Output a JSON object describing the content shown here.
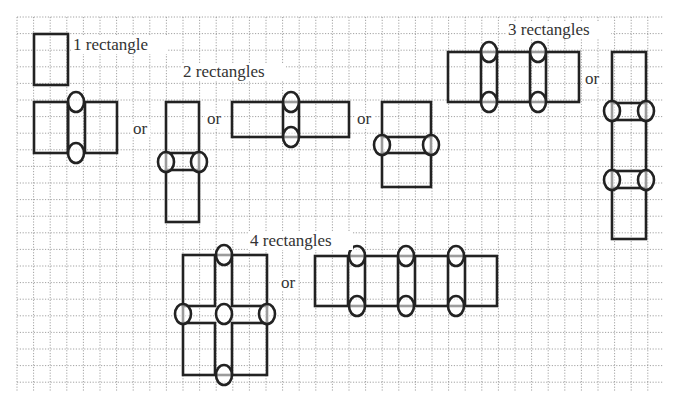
{
  "figure": {
    "width": 676,
    "height": 403,
    "background": "#ffffff",
    "grid": {
      "x0": 17,
      "y0": 17,
      "x1": 663,
      "y1": 392,
      "spacing": 16.6,
      "color": "#8a8a8a"
    },
    "stroke_color": "#222222",
    "text_color": "#333333"
  },
  "labels": [
    {
      "id": "label-1-rectangle",
      "text": "1 rectangle",
      "x": 73,
      "y": 50,
      "w": 92
    },
    {
      "id": "label-2-rectangles",
      "text": "2 rectangles",
      "x": 183,
      "y": 77,
      "w": 101
    },
    {
      "id": "label-3-rectangles",
      "text": "3 rectangles",
      "x": 508,
      "y": 35,
      "w": 101
    },
    {
      "id": "label-4-rectangles",
      "text": "4 rectangles",
      "x": 250,
      "y": 246,
      "w": 101
    }
  ],
  "or_labels": [
    {
      "text": "or",
      "x": 133,
      "y": 134
    },
    {
      "text": "or",
      "x": 207,
      "y": 124
    },
    {
      "text": "or",
      "x": 357,
      "y": 124
    },
    {
      "text": "or",
      "x": 585,
      "y": 84
    },
    {
      "text": "or",
      "x": 281,
      "y": 288
    }
  ],
  "groups": [
    {
      "name": "one-rectangle",
      "count": 1,
      "shapes": [
        {
          "name": "single-vertical",
          "rects": [
            [
              34,
              34,
              34,
              51
            ]
          ],
          "lines": [],
          "ellipses": []
        }
      ]
    },
    {
      "name": "two-rectangles",
      "count": 2,
      "shapes": [
        {
          "name": "two-side-by-side-tall",
          "rects": [
            [
              34,
              102,
              34,
              51
            ],
            [
              85,
              102,
              32,
              51
            ]
          ],
          "lines": [
            [
              68,
              102,
              68,
              153
            ]
          ],
          "ellipses": [
            [
              76,
              102
            ],
            [
              76,
              153
            ]
          ]
        },
        {
          "name": "two-stacked-tall",
          "rects": [
            [
              166,
              102,
              33,
              51
            ],
            [
              166,
              170,
              33,
              52
            ]
          ],
          "lines": [
            [
              166,
              153,
              166,
              170
            ],
            [
              199,
              153,
              199,
              170
            ]
          ],
          "ellipses": [
            [
              166,
              162
            ],
            [
              199,
              162
            ]
          ]
        },
        {
          "name": "two-side-by-side-wide",
          "rects": [
            [
              232,
              102,
              51,
              35
            ],
            [
              299,
              102,
              50,
              35
            ]
          ],
          "lines": [
            [
              283,
              102,
              299,
              102
            ],
            [
              283,
              137,
              299,
              137
            ]
          ],
          "ellipses": [
            [
              291,
              102
            ],
            [
              291,
              137
            ]
          ]
        },
        {
          "name": "two-stacked-wide",
          "rects": [
            [
              382,
              102,
              49,
              35
            ],
            [
              382,
              153,
              49,
              34
            ]
          ],
          "lines": [
            [
              382,
              137,
              382,
              153
            ],
            [
              431,
              137,
              431,
              153
            ]
          ],
          "ellipses": [
            [
              382,
              145
            ],
            [
              431,
              145
            ]
          ]
        }
      ]
    },
    {
      "name": "three-rectangles",
      "count": 3,
      "shapes": [
        {
          "name": "three-in-a-row",
          "rects": [
            [
              448,
              52,
              33,
              50
            ],
            [
              497,
              52,
              33,
              50
            ],
            [
              546,
              52,
              33,
              50
            ]
          ],
          "lines": [
            [
              481,
              52,
              497,
              52
            ],
            [
              481,
              102,
              497,
              102
            ],
            [
              530,
              52,
              546,
              52
            ],
            [
              530,
              102,
              546,
              102
            ]
          ],
          "ellipses": [
            [
              489,
              52
            ],
            [
              489,
              102
            ],
            [
              538,
              52
            ],
            [
              538,
              102
            ]
          ]
        },
        {
          "name": "three-in-a-column",
          "rects": [
            [
              612,
              52,
              34,
              51
            ],
            [
              612,
              120,
              34,
              51
            ],
            [
              612,
              188,
              34,
              51
            ]
          ],
          "lines": [
            [
              612,
              103,
              612,
              120
            ],
            [
              646,
              103,
              646,
              120
            ],
            [
              612,
              171,
              612,
              188
            ],
            [
              646,
              171,
              646,
              188
            ]
          ],
          "ellipses": [
            [
              612,
              111
            ],
            [
              646,
              111
            ],
            [
              612,
              180
            ],
            [
              646,
              180
            ]
          ]
        }
      ]
    },
    {
      "name": "four-rectangles",
      "count": 4,
      "shapes": [
        {
          "name": "four-in-a-square",
          "rects": [
            [
              183,
              255,
              32,
              51
            ],
            [
              232,
              255,
              35,
              51
            ],
            [
              183,
              323,
              32,
              52
            ],
            [
              232,
              323,
              35,
              52
            ]
          ],
          "lines": [
            [
              215,
              255,
              232,
              255
            ],
            [
              215,
              375,
              232,
              375
            ],
            [
              183,
              306,
              183,
              323
            ],
            [
              267,
              306,
              267,
              323
            ]
          ],
          "ellipses": [
            [
              224,
              255
            ],
            [
              224,
              375
            ],
            [
              183,
              314
            ],
            [
              267,
              314
            ],
            [
              224,
              314
            ]
          ]
        },
        {
          "name": "four-in-a-row",
          "rects": [
            [
              315,
              256,
              33,
              50
            ],
            [
              365,
              256,
              33,
              50
            ],
            [
              415,
              256,
              33,
              50
            ],
            [
              465,
              256,
              32,
              50
            ]
          ],
          "lines": [
            [
              348,
              256,
              365,
              256
            ],
            [
              348,
              306,
              365,
              306
            ],
            [
              398,
              256,
              415,
              256
            ],
            [
              398,
              306,
              415,
              306
            ],
            [
              448,
              256,
              465,
              256
            ],
            [
              448,
              306,
              465,
              306
            ]
          ],
          "ellipses": [
            [
              357,
              256
            ],
            [
              357,
              306
            ],
            [
              406,
              256
            ],
            [
              406,
              306
            ],
            [
              456,
              256
            ],
            [
              456,
              306
            ]
          ]
        }
      ]
    }
  ],
  "ellipse_size": {
    "rx": 8,
    "ry": 10
  }
}
